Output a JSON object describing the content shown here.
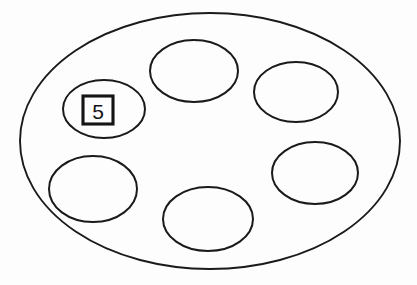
{
  "figure": {
    "background_color": "#fdfdfd",
    "line_color": "#1a1a1a",
    "canvas": {
      "width": 417,
      "height": 285
    }
  },
  "outer_region": {
    "name": "outer-boundary-ellipse",
    "shape": "ellipse",
    "cx": 210,
    "cy": 141,
    "rx": 190,
    "ry": 128,
    "stroke_width": 1.9
  },
  "inner_regions": [
    {
      "id": "hole-top-center",
      "shape": "ellipse",
      "cx": 194,
      "cy": 71,
      "rx": 44,
      "ry": 31,
      "label": ""
    },
    {
      "id": "hole-top-right",
      "shape": "ellipse",
      "cx": 296,
      "cy": 92,
      "rx": 42,
      "ry": 30,
      "label": ""
    },
    {
      "id": "hole-upper-left",
      "shape": "ellipse",
      "cx": 104,
      "cy": 109,
      "rx": 41,
      "ry": 29,
      "label": "5"
    },
    {
      "id": "hole-lower-left",
      "shape": "ellipse",
      "cx": 93,
      "cy": 189,
      "rx": 44,
      "ry": 33,
      "label": ""
    },
    {
      "id": "hole-right-middle",
      "shape": "ellipse",
      "cx": 315,
      "cy": 173,
      "rx": 43,
      "ry": 31,
      "label": ""
    },
    {
      "id": "hole-bottom-center",
      "shape": "ellipse",
      "cx": 208,
      "cy": 219,
      "rx": 45,
      "ry": 32,
      "label": ""
    }
  ],
  "label_marker": {
    "id": "label-box-5",
    "text": "5",
    "shape": "square",
    "x": 83,
    "y": 96,
    "width": 30,
    "height": 28,
    "text_color": "#141414",
    "border_color": "#141414",
    "fill_color": "#fdfdfd"
  }
}
